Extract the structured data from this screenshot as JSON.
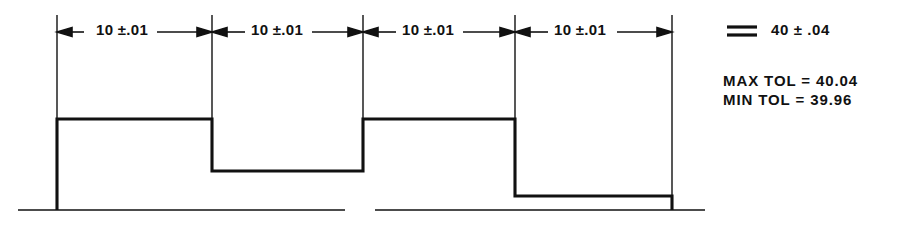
{
  "drawing": {
    "title": "Stepped part with chain dimensioning and tolerance accumulation",
    "line_color": "#111111",
    "background_color": "#ffffff",
    "dimensions": [
      {
        "label": "10 ±.01",
        "nominal": 10,
        "tolerance": 0.01,
        "left_x": 57,
        "right_x": 212
      },
      {
        "label": "10 ±.01",
        "nominal": 10,
        "tolerance": 0.01,
        "left_x": 212,
        "right_x": 363
      },
      {
        "label": "10 ±.01",
        "nominal": 10,
        "tolerance": 0.01,
        "left_x": 363,
        "right_x": 515
      },
      {
        "label": "10 ±.01",
        "nominal": 10,
        "tolerance": 0.01,
        "left_x": 515,
        "right_x": 672
      }
    ],
    "equals_symbol": "=",
    "total": {
      "label": "40 ± .04",
      "nominal": 40,
      "tolerance": 0.04
    },
    "tolerance_notes": [
      {
        "name": "MAX TOL",
        "equals": "=",
        "value": "40.04"
      },
      {
        "name": "MIN TOL",
        "equals": "=",
        "value": "39.96"
      }
    ],
    "tolerance_lines": [
      "MAX TOL = 40.04",
      "MIN TOL = 39.96"
    ],
    "profile": {
      "baseline_y": 210,
      "top_level_y": 119,
      "step_level_y": 171,
      "low_level_y": 196,
      "points": "57,210 57,119 212,119 212,171 363,171 363,119 515,119 515,196 672,196 672,210"
    },
    "baseline": {
      "segments": [
        {
          "x1": 18,
          "x2": 345
        },
        {
          "x1": 375,
          "x2": 705
        }
      ]
    },
    "extension_lines": [
      {
        "x": 57,
        "y1": 15,
        "y2": 119
      },
      {
        "x": 212,
        "y1": 15,
        "y2": 119
      },
      {
        "x": 363,
        "y1": 15,
        "y2": 119
      },
      {
        "x": 515,
        "y1": 15,
        "y2": 119
      },
      {
        "x": 672,
        "y1": 15,
        "y2": 196
      }
    ]
  }
}
